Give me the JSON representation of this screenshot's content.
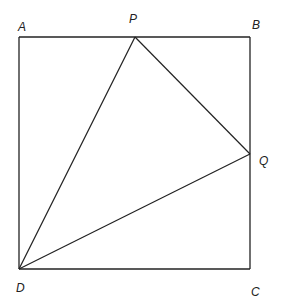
{
  "diagram": {
    "type": "geometry",
    "stroke_color": "#222222",
    "background": "#ffffff",
    "points": {
      "A": {
        "label": "A",
        "x": 19,
        "y": 37,
        "label_x": 18,
        "label_y": 31
      },
      "B": {
        "label": "B",
        "x": 250,
        "y": 37,
        "label_x": 252,
        "label_y": 29
      },
      "C": {
        "label": "C",
        "x": 250,
        "y": 269,
        "label_x": 251,
        "label_y": 296
      },
      "D": {
        "label": "D",
        "x": 19,
        "y": 269,
        "label_x": 16,
        "label_y": 292
      },
      "P": {
        "label": "P",
        "x": 135,
        "y": 37,
        "label_x": 129,
        "label_y": 23
      },
      "Q": {
        "label": "Q",
        "x": 250,
        "y": 154,
        "label_x": 259,
        "label_y": 165
      }
    },
    "segments": [
      {
        "from": "A",
        "to": "B"
      },
      {
        "from": "B",
        "to": "C"
      },
      {
        "from": "C",
        "to": "D"
      },
      {
        "from": "D",
        "to": "A"
      },
      {
        "from": "D",
        "to": "P"
      },
      {
        "from": "P",
        "to": "Q"
      },
      {
        "from": "Q",
        "to": "D"
      }
    ]
  }
}
